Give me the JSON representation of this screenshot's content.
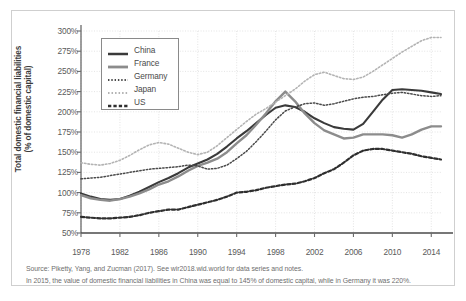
{
  "chart_data": {
    "type": "line",
    "title": "",
    "xlabel": "",
    "ylabel": "Total domestic financial liabilities\n(% of domestic capital)",
    "ylabel_line1": "Total domestic financial liabilities",
    "ylabel_line2": "(% of domestic capital)",
    "xlim": [
      1978,
      2015
    ],
    "ylim": [
      50,
      300
    ],
    "grid": true,
    "legend_position": "upper-left",
    "ytick_labels": [
      "300%",
      "275%",
      "250%",
      "225%",
      "200%",
      "175%",
      "150%",
      "125%",
      "100%",
      "75%",
      "50%"
    ],
    "ytick_values": [
      300,
      275,
      250,
      225,
      200,
      175,
      150,
      125,
      100,
      75,
      50
    ],
    "xtick_labels": [
      "1978",
      "1982",
      "1986",
      "1990",
      "1994",
      "1998",
      "2002",
      "2006",
      "2010",
      "2014"
    ],
    "xtick_values": [
      1978,
      1982,
      1986,
      1990,
      1994,
      1998,
      2002,
      2006,
      2010,
      2014
    ],
    "x": [
      1978,
      1979,
      1980,
      1981,
      1982,
      1983,
      1984,
      1985,
      1986,
      1987,
      1988,
      1989,
      1990,
      1991,
      1992,
      1993,
      1994,
      1995,
      1996,
      1997,
      1998,
      1999,
      2000,
      2001,
      2002,
      2003,
      2004,
      2005,
      2006,
      2007,
      2008,
      2009,
      2010,
      2011,
      2012,
      2013,
      2014,
      2015
    ],
    "series": [
      {
        "name": "China",
        "color": "#3a3a3a",
        "style": "solid",
        "width": 2.1,
        "values": [
          99,
          95,
          92,
          91,
          92,
          96,
          101,
          107,
          113,
          118,
          124,
          131,
          136,
          141,
          148,
          157,
          167,
          176,
          186,
          196,
          205,
          208,
          206,
          200,
          192,
          186,
          181,
          179,
          178,
          185,
          200,
          215,
          227,
          228,
          227,
          226,
          224,
          222
        ]
      },
      {
        "name": "France",
        "color": "#8c8c8c",
        "style": "solid",
        "width": 2.4,
        "values": [
          97,
          93,
          91,
          90,
          92,
          95,
          99,
          104,
          110,
          114,
          120,
          127,
          133,
          137,
          142,
          150,
          161,
          171,
          184,
          198,
          213,
          225,
          213,
          198,
          186,
          177,
          172,
          167,
          168,
          172,
          172,
          172,
          171,
          168,
          172,
          178,
          182,
          182
        ]
      },
      {
        "name": "Germany",
        "color": "#4a4a4a",
        "style": "dotted",
        "width": 1.5,
        "values": [
          117,
          118,
          119,
          121,
          123,
          125,
          127,
          129,
          130,
          131,
          132,
          134,
          133,
          129,
          130,
          134,
          142,
          151,
          163,
          176,
          190,
          201,
          206,
          210,
          211,
          208,
          210,
          213,
          216,
          218,
          219,
          221,
          223,
          224,
          222,
          220,
          219,
          220
        ]
      },
      {
        "name": "Japan",
        "color": "#b3b3b3",
        "style": "dotted",
        "width": 1.6,
        "values": [
          137,
          135,
          134,
          136,
          140,
          146,
          153,
          159,
          162,
          160,
          155,
          150,
          147,
          150,
          158,
          168,
          178,
          188,
          197,
          204,
          212,
          220,
          228,
          238,
          246,
          249,
          245,
          241,
          240,
          243,
          250,
          258,
          266,
          274,
          281,
          288,
          292,
          292
        ]
      },
      {
        "name": "US",
        "color": "#2e2e2e",
        "style": "dashed",
        "width": 2.2,
        "values": [
          70,
          69,
          68,
          68,
          69,
          70,
          72,
          75,
          77,
          79,
          79,
          82,
          85,
          88,
          91,
          95,
          100,
          101,
          103,
          106,
          108,
          110,
          111,
          114,
          118,
          124,
          129,
          137,
          146,
          152,
          154,
          154,
          152,
          150,
          148,
          145,
          143,
          141
        ]
      }
    ]
  },
  "legend": {
    "items": [
      {
        "label": "China"
      },
      {
        "label": "France"
      },
      {
        "label": "Germany"
      },
      {
        "label": "Japan"
      },
      {
        "label": "US"
      }
    ]
  },
  "footnote": {
    "line1": "Source: Piketty, Yang, and Zucman (2017). See wir2018.wid.world for data series and notes.",
    "line2": "In 2015, the value of domestic financial liabilities in China was equal to 145% of domestic capital, while in Germany it was 220%."
  }
}
